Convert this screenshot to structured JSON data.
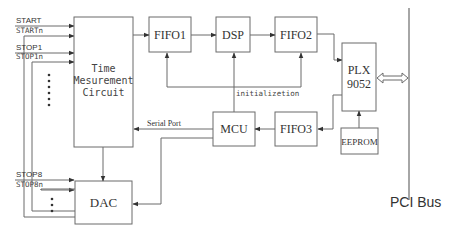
{
  "diagram": {
    "blocks": {
      "tmc": {
        "line1": "Time",
        "line2": "Mesurement",
        "line3": "Circuit"
      },
      "fifo1": "FIFO1",
      "dsp": "DSP",
      "fifo2": "FIFO2",
      "plx": {
        "line1": "PLX",
        "line2": "9052"
      },
      "fifo3": "FIFO3",
      "mcu": "MCU",
      "eeprom": "EEPROM",
      "dac": "DAC"
    },
    "signals": {
      "start": "START",
      "startn": "STARTn",
      "stop1": "STOP1",
      "stop1n": "STOP1n",
      "stop8": "STOP8",
      "stop8n": "STOP8n",
      "threshold": "Threshold",
      "serial_port": "Serial Port",
      "initialization": "initializetion"
    },
    "bus_label": "PCI Bus",
    "colors": {
      "line": "#6b6b6b",
      "text": "#333333",
      "background": "#ffffff"
    }
  }
}
